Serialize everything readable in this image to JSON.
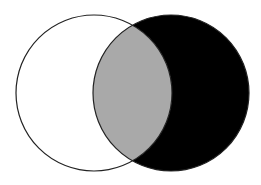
{
  "diagram": {
    "type": "venn",
    "colors": {
      "background": "#ffffff",
      "left_fill": "#ffffff",
      "intersection_fill": "#a9a9a9",
      "right_only_fill": "#000000",
      "stroke": "#222222"
    },
    "circles": [
      {
        "name": "A",
        "cx": 94,
        "cy": 93,
        "r": 78
      },
      {
        "name": "B",
        "cx": 171,
        "cy": 93,
        "r": 78
      }
    ]
  }
}
